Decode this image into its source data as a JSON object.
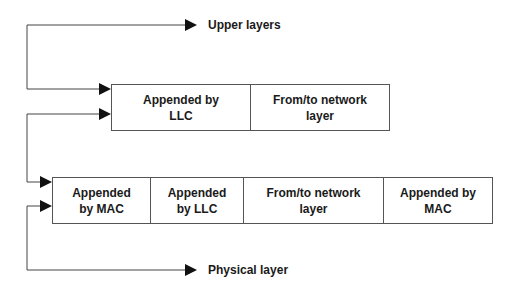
{
  "labels": {
    "upper": "Upper layers",
    "physical": "Physical layer"
  },
  "llc_frame": {
    "cells": [
      {
        "text": "Appended by\nLLC"
      },
      {
        "text": "From/to network\nlayer"
      }
    ]
  },
  "mac_frame": {
    "cells": [
      {
        "text": "Appended\nby MAC"
      },
      {
        "text": "Appended\nby LLC"
      },
      {
        "text": "From/to network\nlayer"
      },
      {
        "text": "Appended by\nMAC"
      }
    ]
  },
  "colors": {
    "line": "#444444",
    "text": "#1a1a1a"
  }
}
